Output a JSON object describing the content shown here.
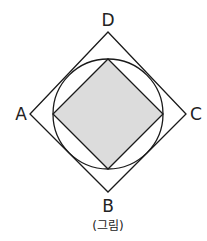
{
  "figure": {
    "caption": "(그림)",
    "vertices": {
      "A": "A",
      "B": "B",
      "C": "C",
      "D": "D"
    },
    "shapes": {
      "outer_square": "ABCD square rotated 45°",
      "inscribed_circle": "circle inscribed in ABCD",
      "inner_square": "square inscribed in circle, shaded"
    },
    "colors": {
      "stroke": "#1a1a1a",
      "shade": "#dcdcdc",
      "background": "#ffffff"
    }
  }
}
